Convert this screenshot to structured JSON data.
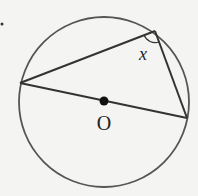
{
  "diagram": {
    "center_label": "O",
    "angle_label": "x",
    "stroke_color": "#444444",
    "circle_color": "#555555",
    "background": "#f4f4f2"
  }
}
